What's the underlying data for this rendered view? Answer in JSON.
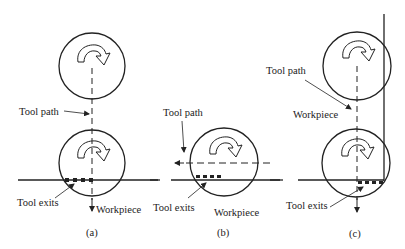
{
  "figure": {
    "type": "milling tool exit diagram",
    "panels": [
      {
        "id": "a",
        "caption": "(a)",
        "labels": {
          "tool_path": "Tool path",
          "tool_exits": "Tool exits",
          "workpiece": "Workpiece"
        },
        "description": "Tool moves vertically downward, perpendicular to workpiece edge"
      },
      {
        "id": "b",
        "caption": "(b)",
        "labels": {
          "tool_path": "Tool path",
          "tool_exits": "Tool exits",
          "workpiece": "Workpiece"
        },
        "description": "Tool moves horizontally leftward, parallel to workpiece edge"
      },
      {
        "id": "c",
        "caption": "(c)",
        "labels": {
          "tool_path": "Tool path",
          "workpiece": "Workpiece",
          "tool_exits": "Tool exits"
        },
        "description": "Tool moves vertically downward along a corner of the workpiece"
      }
    ],
    "colors": {
      "line": "#222222",
      "background": "#ffffff"
    }
  }
}
